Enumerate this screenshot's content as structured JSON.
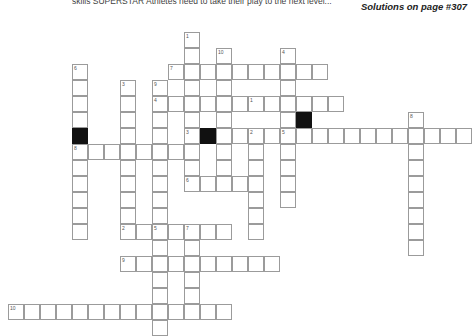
{
  "header": {
    "intro_text": "skills SUPERSTAR Athletes need to take their play to the next level...",
    "solutions_note": "Solutions on page #307"
  },
  "puzzle": {
    "title": "Crossword Puzzle Grid",
    "cell_size": 16,
    "origin_x": 8,
    "origin_y": 16,
    "colors": {
      "cell_border": "#9b9b9b",
      "cell_fill": "#ffffff",
      "block_fill": "#111111",
      "number_text": "#555555"
    },
    "entries": [
      {
        "number": "1",
        "direction": "down",
        "col": 11,
        "row": 1,
        "length": 8
      },
      {
        "number": "10",
        "direction": "down",
        "col": 13,
        "row": 2,
        "length": 6
      },
      {
        "number": "7",
        "direction": "across",
        "col": 10,
        "row": 3,
        "length": 10
      },
      {
        "number": "4",
        "direction": "down",
        "col": 17,
        "row": 2,
        "length": 8
      },
      {
        "number": "6",
        "direction": "down",
        "col": 4,
        "row": 3,
        "length": 11
      },
      {
        "number": "3",
        "direction": "down",
        "col": 7,
        "row": 4,
        "length": 9
      },
      {
        "number": "9",
        "direction": "down",
        "col": 9,
        "row": 4,
        "length": 9
      },
      {
        "number": "1",
        "direction": "across",
        "col": 15,
        "row": 5,
        "length": 12
      },
      {
        "number": "4",
        "direction": "across",
        "col": 9,
        "row": 5,
        "length": 12
      },
      {
        "number": "8",
        "direction": "down",
        "col": 25,
        "row": 6,
        "length": 9
      },
      {
        "number": "3",
        "direction": "across",
        "col": 11,
        "row": 7,
        "length": 6
      },
      {
        "number": "2",
        "direction": "down",
        "col": 15,
        "row": 7,
        "length": 7
      },
      {
        "number": "8",
        "direction": "across",
        "col": 4,
        "row": 8,
        "length": 6
      },
      {
        "number": "5",
        "direction": "across",
        "col": 17,
        "row": 7,
        "length": 12
      },
      {
        "number": "6",
        "direction": "across",
        "col": 11,
        "row": 10,
        "length": 4
      },
      {
        "number": "2",
        "direction": "across",
        "col": 7,
        "row": 13,
        "length": 7
      },
      {
        "number": "5",
        "direction": "down",
        "col": 9,
        "row": 13,
        "length": 7
      },
      {
        "number": "7",
        "direction": "down",
        "col": 11,
        "row": 13,
        "length": 6
      },
      {
        "number": "9",
        "direction": "across",
        "col": 7,
        "row": 15,
        "length": 10
      },
      {
        "number": "10",
        "direction": "across",
        "col": 0,
        "row": 18,
        "length": 16
      }
    ],
    "cells": [
      {
        "c": 11,
        "r": 1,
        "n": "1"
      },
      {
        "c": 11,
        "r": 2
      },
      {
        "c": 13,
        "r": 2,
        "n": "10"
      },
      {
        "c": 17,
        "r": 2,
        "n": "4"
      },
      {
        "c": 10,
        "r": 3,
        "n": "7"
      },
      {
        "c": 11,
        "r": 3
      },
      {
        "c": 12,
        "r": 3
      },
      {
        "c": 13,
        "r": 3
      },
      {
        "c": 14,
        "r": 3
      },
      {
        "c": 15,
        "r": 3
      },
      {
        "c": 16,
        "r": 3
      },
      {
        "c": 17,
        "r": 3
      },
      {
        "c": 18,
        "r": 3
      },
      {
        "c": 19,
        "r": 3
      },
      {
        "c": 4,
        "r": 3,
        "n": "6"
      },
      {
        "c": 11,
        "r": 4
      },
      {
        "c": 13,
        "r": 4
      },
      {
        "c": 17,
        "r": 4
      },
      {
        "c": 4,
        "r": 4
      },
      {
        "c": 7,
        "r": 4,
        "n": "3"
      },
      {
        "c": 9,
        "r": 4,
        "n": "9"
      },
      {
        "c": 9,
        "r": 5,
        "n": "4"
      },
      {
        "c": 10,
        "r": 5
      },
      {
        "c": 11,
        "r": 5
      },
      {
        "c": 12,
        "r": 5
      },
      {
        "c": 13,
        "r": 5
      },
      {
        "c": 14,
        "r": 5
      },
      {
        "c": 15,
        "r": 5,
        "n": "1"
      },
      {
        "c": 16,
        "r": 5
      },
      {
        "c": 17,
        "r": 5
      },
      {
        "c": 18,
        "r": 5
      },
      {
        "c": 19,
        "r": 5
      },
      {
        "c": 20,
        "r": 5
      },
      {
        "c": 4,
        "r": 5
      },
      {
        "c": 7,
        "r": 5
      },
      {
        "c": 11,
        "r": 6
      },
      {
        "c": 13,
        "r": 6
      },
      {
        "c": 17,
        "r": 6
      },
      {
        "c": 4,
        "r": 6
      },
      {
        "c": 7,
        "r": 6
      },
      {
        "c": 9,
        "r": 6
      },
      {
        "c": 18,
        "r": 6,
        "black": true
      },
      {
        "c": 25,
        "r": 6,
        "n": "8"
      },
      {
        "c": 11,
        "r": 7,
        "n": "3"
      },
      {
        "c": 12,
        "r": 7,
        "black": true
      },
      {
        "c": 13,
        "r": 7
      },
      {
        "c": 14,
        "r": 7
      },
      {
        "c": 15,
        "r": 7,
        "n": "2"
      },
      {
        "c": 16,
        "r": 7
      },
      {
        "c": 17,
        "r": 7,
        "n": "5"
      },
      {
        "c": 18,
        "r": 7
      },
      {
        "c": 19,
        "r": 7
      },
      {
        "c": 20,
        "r": 7
      },
      {
        "c": 21,
        "r": 7
      },
      {
        "c": 22,
        "r": 7
      },
      {
        "c": 23,
        "r": 7
      },
      {
        "c": 24,
        "r": 7
      },
      {
        "c": 25,
        "r": 7
      },
      {
        "c": 26,
        "r": 7
      },
      {
        "c": 27,
        "r": 7
      },
      {
        "c": 28,
        "r": 7
      },
      {
        "c": 4,
        "r": 7,
        "black": true
      },
      {
        "c": 7,
        "r": 7
      },
      {
        "c": 9,
        "r": 7
      },
      {
        "c": 4,
        "r": 8,
        "n": "8"
      },
      {
        "c": 5,
        "r": 8
      },
      {
        "c": 6,
        "r": 8
      },
      {
        "c": 7,
        "r": 8
      },
      {
        "c": 8,
        "r": 8
      },
      {
        "c": 9,
        "r": 8
      },
      {
        "c": 10,
        "r": 8
      },
      {
        "c": 11,
        "r": 8
      },
      {
        "c": 13,
        "r": 8
      },
      {
        "c": 15,
        "r": 8
      },
      {
        "c": 17,
        "r": 8
      },
      {
        "c": 25,
        "r": 8
      },
      {
        "c": 4,
        "r": 9
      },
      {
        "c": 7,
        "r": 9
      },
      {
        "c": 9,
        "r": 9
      },
      {
        "c": 11,
        "r": 9
      },
      {
        "c": 13,
        "r": 9
      },
      {
        "c": 15,
        "r": 9
      },
      {
        "c": 17,
        "r": 9
      },
      {
        "c": 25,
        "r": 9
      },
      {
        "c": 11,
        "r": 10,
        "n": "6"
      },
      {
        "c": 12,
        "r": 10
      },
      {
        "c": 13,
        "r": 10
      },
      {
        "c": 14,
        "r": 10
      },
      {
        "c": 4,
        "r": 10
      },
      {
        "c": 7,
        "r": 10
      },
      {
        "c": 9,
        "r": 10
      },
      {
        "c": 15,
        "r": 10
      },
      {
        "c": 17,
        "r": 10
      },
      {
        "c": 25,
        "r": 10
      },
      {
        "c": 4,
        "r": 11
      },
      {
        "c": 7,
        "r": 11
      },
      {
        "c": 9,
        "r": 11
      },
      {
        "c": 15,
        "r": 11
      },
      {
        "c": 17,
        "r": 11
      },
      {
        "c": 25,
        "r": 11
      },
      {
        "c": 4,
        "r": 12
      },
      {
        "c": 7,
        "r": 12
      },
      {
        "c": 9,
        "r": 12
      },
      {
        "c": 15,
        "r": 12
      },
      {
        "c": 25,
        "r": 12
      },
      {
        "c": 7,
        "r": 13,
        "n": "2"
      },
      {
        "c": 8,
        "r": 13
      },
      {
        "c": 9,
        "r": 13,
        "n": "5"
      },
      {
        "c": 10,
        "r": 13
      },
      {
        "c": 11,
        "r": 13,
        "n": "7"
      },
      {
        "c": 12,
        "r": 13
      },
      {
        "c": 13,
        "r": 13
      },
      {
        "c": 4,
        "r": 13
      },
      {
        "c": 15,
        "r": 13
      },
      {
        "c": 25,
        "r": 13
      },
      {
        "c": 9,
        "r": 14
      },
      {
        "c": 11,
        "r": 14
      },
      {
        "c": 25,
        "r": 14
      },
      {
        "c": 7,
        "r": 15,
        "n": "9"
      },
      {
        "c": 8,
        "r": 15
      },
      {
        "c": 9,
        "r": 15
      },
      {
        "c": 10,
        "r": 15
      },
      {
        "c": 11,
        "r": 15
      },
      {
        "c": 12,
        "r": 15
      },
      {
        "c": 13,
        "r": 15
      },
      {
        "c": 14,
        "r": 15
      },
      {
        "c": 15,
        "r": 15
      },
      {
        "c": 16,
        "r": 15
      },
      {
        "c": 9,
        "r": 16
      },
      {
        "c": 11,
        "r": 16
      },
      {
        "c": 9,
        "r": 17
      },
      {
        "c": 11,
        "r": 17
      },
      {
        "c": 0,
        "r": 18,
        "n": "10"
      },
      {
        "c": 1,
        "r": 18
      },
      {
        "c": 2,
        "r": 18
      },
      {
        "c": 3,
        "r": 18
      },
      {
        "c": 4,
        "r": 18
      },
      {
        "c": 5,
        "r": 18
      },
      {
        "c": 6,
        "r": 18
      },
      {
        "c": 7,
        "r": 18
      },
      {
        "c": 8,
        "r": 18
      },
      {
        "c": 9,
        "r": 18
      },
      {
        "c": 10,
        "r": 18
      },
      {
        "c": 11,
        "r": 18
      },
      {
        "c": 12,
        "r": 18
      },
      {
        "c": 13,
        "r": 18
      },
      {
        "c": 9,
        "r": 19
      }
    ]
  }
}
